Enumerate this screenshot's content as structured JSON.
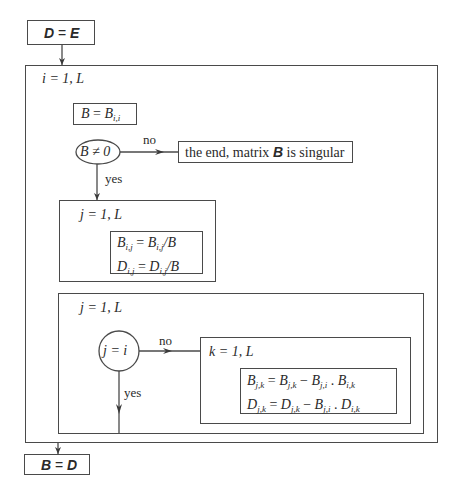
{
  "diagram": {
    "type": "flowchart (Nassi-Shneiderman style)",
    "start_box": {
      "lhs": "D",
      "op": "=",
      "rhs": "E"
    },
    "outer_loop": {
      "label": "i = 1, L"
    },
    "pivot_assign": {
      "lhs": "B",
      "op": "=",
      "rhs": "B",
      "rhs_sub": "i,i"
    },
    "decision_1": {
      "condition": "B ≠ 0",
      "no_label": "no",
      "yes_label": "yes",
      "no_target": {
        "text_before": "the end, matrix",
        "bold": "B",
        "text_after": "is singular"
      }
    },
    "loop_normalize": {
      "label": "j = 1, L",
      "formulas": [
        {
          "lhs": "B",
          "lhs_sub": "i,j",
          "rhs": "B",
          "rhs_sub": "i,j",
          "tail": "/B"
        },
        {
          "lhs": "D",
          "lhs_sub": "i,j",
          "rhs": "D",
          "rhs_sub": "i,j",
          "tail": "/B"
        }
      ]
    },
    "loop_eliminate": {
      "label": "j = 1, L",
      "decision": {
        "condition": "j = i",
        "no_label": "no",
        "yes_label": "yes"
      },
      "inner_loop": {
        "label": "k = 1, L",
        "formulas": [
          {
            "lhs": "B",
            "lhs_sub": "j,k",
            "t1": "B",
            "t1_sub": "j,k",
            "t2": "B",
            "t2_sub": "j,i",
            "t3": "B",
            "t3_sub": "i,k"
          },
          {
            "lhs": "D",
            "lhs_sub": "j,k",
            "t1": "D",
            "t1_sub": "j,k",
            "t2": "B",
            "t2_sub": "j,i",
            "t3": "D",
            "t3_sub": "i,k"
          }
        ]
      }
    },
    "end_box": {
      "lhs": "B",
      "op": "=",
      "rhs": "D"
    },
    "colors": {
      "line": "#4a4a4a",
      "text": "#2a2a2a",
      "background": "#ffffff"
    }
  }
}
